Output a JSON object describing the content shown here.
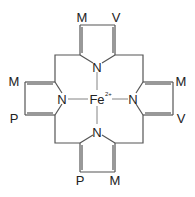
{
  "diagram": {
    "type": "structural-formula",
    "center_atom": {
      "label": "Fe",
      "charge": "2+"
    },
    "nitrogens": [
      "N",
      "N",
      "N",
      "N"
    ],
    "pyrroles": {
      "top": {
        "substituents": [
          "M",
          "V"
        ]
      },
      "left": {
        "substituents": [
          "M",
          "P"
        ]
      },
      "right": {
        "substituents": [
          "M",
          "V"
        ]
      },
      "bottom": {
        "substituents": [
          "P",
          "M"
        ]
      }
    },
    "colors": {
      "line": "#555555",
      "text": "#222222",
      "background": "#ffffff"
    }
  }
}
